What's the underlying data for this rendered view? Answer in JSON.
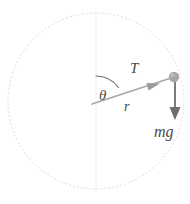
{
  "figure": {
    "name": "circular-motion-free-body-diagram",
    "background_color": "#ffffff",
    "width": 190,
    "height": 204
  },
  "colors": {
    "circle_stroke": "#d9d9d9",
    "axis_stroke": "#d9d9d9",
    "radius_line": "#a0a0a0",
    "arc_stroke": "#6e6e6e",
    "ball_fill": "#a8a8a8",
    "weight_arrow": "#6e6e6e",
    "label_text": "#4a4a4a"
  },
  "geometry": {
    "circle": {
      "cx": 96,
      "cy": 101,
      "r": 88,
      "dash": "1 3"
    },
    "vertical_axis": {
      "x": 96,
      "y1": 13,
      "y2": 190,
      "dash": "1 3"
    },
    "center": {
      "x": 92,
      "y": 104
    },
    "ball": {
      "x": 174,
      "y": 77,
      "r": 5
    },
    "angle_arc": {
      "radius": 28,
      "start_deg": 270,
      "end_deg": 342
    },
    "tension_arrow_tip": {
      "x": 158,
      "y": 85
    },
    "weight_arrow": {
      "x": 175,
      "y1": 80,
      "y2": 119
    }
  },
  "labels": {
    "angle": {
      "text": "θ",
      "x": 100,
      "y": 99
    },
    "tension": {
      "text": "T",
      "x": 131,
      "y": 72
    },
    "radius": {
      "text": "r",
      "x": 124,
      "y": 110
    },
    "weight": {
      "text": "mg",
      "x": 155,
      "y": 136
    }
  },
  "icons": {
    "ball": "particle-dot-icon",
    "tension_arrow": "arrow-outward-icon",
    "weight_arrow": "arrow-down-icon",
    "orbit_path": "dotted-circle-icon",
    "vertical_reference": "dotted-vertical-line-icon",
    "angle_marker": "arc-angle-icon"
  }
}
